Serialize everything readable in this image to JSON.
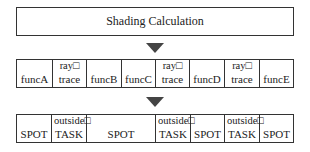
{
  "title_box": {
    "label": "Shading Calculation"
  },
  "arrows": [
    {
      "icon": "down-triangle-icon",
      "color": "#444444"
    },
    {
      "icon": "down-triangle-icon",
      "color": "#444444"
    }
  ],
  "row2": {
    "cells": [
      {
        "top": "",
        "main": "funcA",
        "width": 36
      },
      {
        "top": "ray□",
        "main": "trace",
        "width": 34
      },
      {
        "top": "",
        "main": "funcB",
        "width": 35
      },
      {
        "top": "",
        "main": "funcC",
        "width": 34
      },
      {
        "top": "ray□",
        "main": "trace",
        "width": 34
      },
      {
        "top": "",
        "main": "funcD",
        "width": 35
      },
      {
        "top": "ray□",
        "main": "trace",
        "width": 35
      },
      {
        "top": "",
        "main": "funcE",
        "width": 35
      }
    ]
  },
  "row3": {
    "cells": [
      {
        "top": "",
        "main": "SPOT",
        "width": 35
      },
      {
        "top": "outside□",
        "main": "TASK",
        "width": 35
      },
      {
        "top": "",
        "main": "SPOT",
        "width": 69
      },
      {
        "top": "outside□",
        "main": "TASK",
        "width": 35
      },
      {
        "top": "",
        "main": "SPOT",
        "width": 34
      },
      {
        "top": "outside□",
        "main": "TASK",
        "width": 35
      },
      {
        "top": "",
        "main": "SPOT",
        "width": 35
      }
    ]
  }
}
